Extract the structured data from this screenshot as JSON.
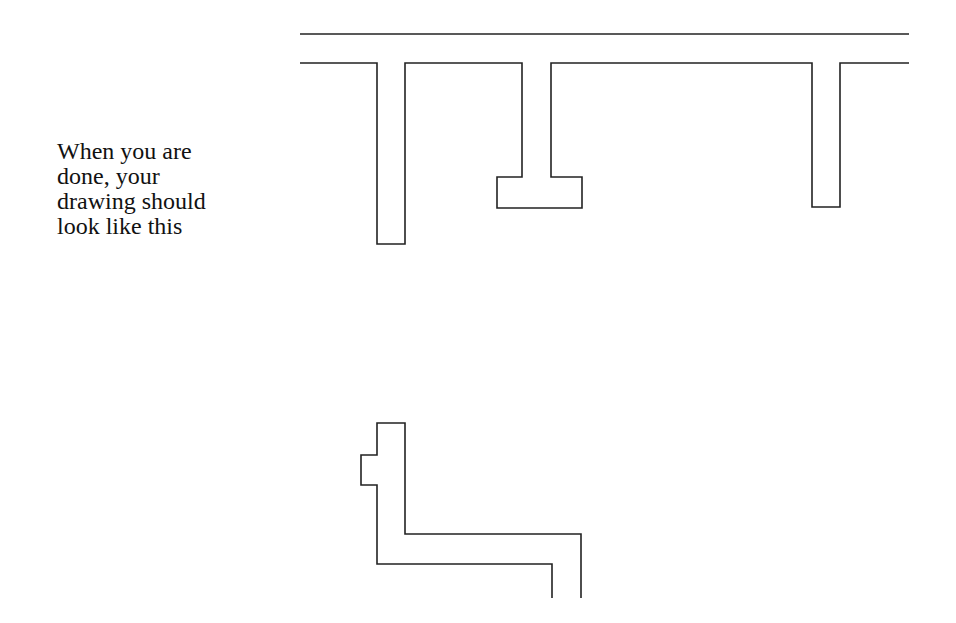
{
  "caption": {
    "lines": [
      "When you are",
      "done, your",
      "drawing should",
      "look like this"
    ]
  },
  "drawing": {
    "stroke_color": "#222222",
    "top_line": "M300 34 L909 34",
    "upper_outline": "M300 63 L377 63 L377 244 L405 244 L405 63 L522 63 L522 177 L497 177 L497 208 L582 208 L582 177 L551 177 L551 63 L812 63 L812 207 L840 207 L840 63 L909 63",
    "lower_outline": "M552 598 L552 564 L377 564 L377 485 L361 485 L361 455 L377 455 L377 423 L405 423 L405 534 L581 534 L581 598"
  }
}
